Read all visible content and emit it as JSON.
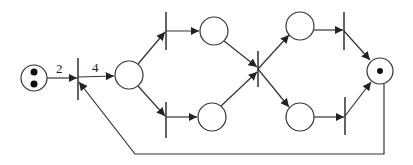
{
  "diagram": {
    "type": "petri-net",
    "colors": {
      "stroke": "#333333",
      "fill": "#ffffff",
      "token": "#111111"
    },
    "places": [
      {
        "id": "p0",
        "cx": 34,
        "cy": 78,
        "r": 13,
        "tokens": 2
      },
      {
        "id": "p1",
        "cx": 129,
        "cy": 75,
        "r": 14,
        "tokens": 0
      },
      {
        "id": "p2",
        "cx": 214,
        "cy": 31,
        "r": 14,
        "tokens": 0
      },
      {
        "id": "p3",
        "cx": 212,
        "cy": 117,
        "r": 14,
        "tokens": 0
      },
      {
        "id": "p4",
        "cx": 300,
        "cy": 26,
        "r": 14,
        "tokens": 0
      },
      {
        "id": "p5",
        "cx": 300,
        "cy": 117,
        "r": 14,
        "tokens": 0
      },
      {
        "id": "p6",
        "cx": 380,
        "cy": 71,
        "r": 13,
        "tokens": 1
      }
    ],
    "transitions": [
      {
        "id": "t0",
        "x": 78,
        "y1": 58,
        "y2": 100
      },
      {
        "id": "t1",
        "x": 166,
        "y1": 12,
        "y2": 50
      },
      {
        "id": "t2",
        "x": 166,
        "y1": 102,
        "y2": 138
      },
      {
        "id": "t3",
        "x": 258,
        "y1": 51,
        "y2": 87
      },
      {
        "id": "t4",
        "x": 344,
        "y1": 12,
        "y2": 50
      },
      {
        "id": "t5",
        "x": 345,
        "y1": 97,
        "y2": 135
      }
    ],
    "arcs": [
      {
        "from": "p0",
        "to": "t0",
        "weight": "2"
      },
      {
        "from": "t0",
        "to": "p1",
        "weight": "4"
      },
      {
        "from": "p1",
        "to": "t1",
        "weight": ""
      },
      {
        "from": "p1",
        "to": "t2",
        "weight": ""
      },
      {
        "from": "t1",
        "to": "p2",
        "weight": ""
      },
      {
        "from": "t2",
        "to": "p3",
        "weight": ""
      },
      {
        "from": "p2",
        "to": "t3",
        "weight": ""
      },
      {
        "from": "p3",
        "to": "t3",
        "weight": ""
      },
      {
        "from": "t3",
        "to": "p4",
        "weight": ""
      },
      {
        "from": "t3",
        "to": "p5",
        "weight": ""
      },
      {
        "from": "p4",
        "to": "t4",
        "weight": ""
      },
      {
        "from": "p5",
        "to": "t5",
        "weight": ""
      },
      {
        "from": "t4",
        "to": "p6",
        "weight": ""
      },
      {
        "from": "t5",
        "to": "p6",
        "weight": ""
      },
      {
        "from": "p6",
        "to": "t0",
        "weight": "",
        "route": "feedback"
      }
    ],
    "labels": {
      "arc_p0_t0": "2",
      "arc_t0_p1": "4"
    }
  }
}
